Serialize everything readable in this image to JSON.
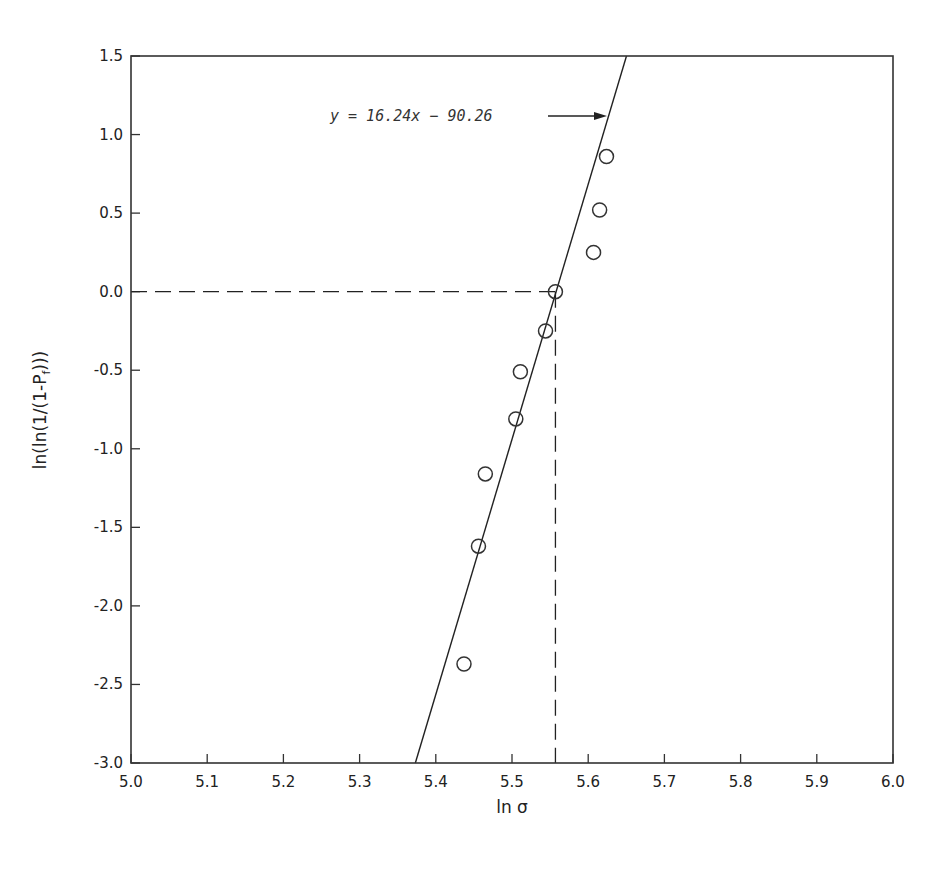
{
  "chart_data": {
    "type": "scatter",
    "title": "",
    "xlabel": "ln σ",
    "ylabel": "ln(ln(1/(1-P_f)))",
    "ylabel_main": "ln(ln(1/(1-P",
    "ylabel_sub": "f",
    "ylabel_tail": ")))",
    "xlim": [
      5.0,
      6.0
    ],
    "ylim": [
      -3.0,
      1.5
    ],
    "x_ticks": [
      "5.0",
      "5.1",
      "5.2",
      "5.3",
      "5.4",
      "5.5",
      "5.6",
      "5.7",
      "5.8",
      "5.9",
      "6.0"
    ],
    "y_ticks": [
      "1.5",
      "1.0",
      "0.5",
      "0.0",
      "-0.5",
      "-1.0",
      "-1.5",
      "-2.0",
      "-2.5",
      "-3.0"
    ],
    "grid": false,
    "series": [
      {
        "name": "data",
        "marker": "open-circle",
        "points": [
          {
            "x": 5.624,
            "y": 0.86
          },
          {
            "x": 5.615,
            "y": 0.52
          },
          {
            "x": 5.607,
            "y": 0.25
          },
          {
            "x": 5.557,
            "y": 0.0
          },
          {
            "x": 5.544,
            "y": -0.25
          },
          {
            "x": 5.511,
            "y": -0.51
          },
          {
            "x": 5.505,
            "y": -0.81
          },
          {
            "x": 5.465,
            "y": -1.16
          },
          {
            "x": 5.456,
            "y": -1.62
          },
          {
            "x": 5.437,
            "y": -2.37
          }
        ]
      },
      {
        "name": "fit",
        "type": "line",
        "slope": 16.24,
        "intercept": -90.26,
        "x_range": [
          5.373,
          5.65
        ]
      }
    ],
    "reference_lines": [
      {
        "type": "horizontal-dashed",
        "y": 0.0,
        "x_from": 5.0,
        "x_to": 5.557
      },
      {
        "type": "vertical-dashed",
        "x": 5.557,
        "y_from": -3.0,
        "y_to": 0.0
      }
    ],
    "annotations": [
      {
        "text": "y = 16.24x − 90.26",
        "arrow_to": "fit line"
      }
    ]
  }
}
